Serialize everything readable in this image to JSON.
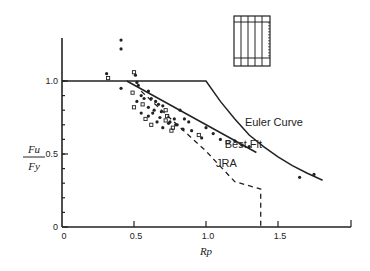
{
  "chart_data": {
    "type": "scatter",
    "title": "",
    "xlabel": "Rp",
    "ylabel": "Fu / Fy",
    "ylabel_num": "Fu",
    "ylabel_den": "Fy",
    "xlim": [
      0,
      2.0
    ],
    "ylim": [
      0,
      1.35
    ],
    "grid": false,
    "x_ticks": [
      0,
      0.5,
      1.0,
      1.5
    ],
    "x_tick_labels": [
      "0",
      "0.5",
      "1.0",
      "1.5"
    ],
    "y_ticks": [
      0,
      0.5,
      1.0
    ],
    "y_tick_labels": [
      "0",
      "0.5",
      "1.0"
    ],
    "y_minor_step": 0.1,
    "series": [
      {
        "name": "Euler Curve",
        "kind": "line",
        "style": "solid",
        "x": [
          0,
          1.0,
          1.1,
          1.2,
          1.3,
          1.4,
          1.5,
          1.6,
          1.7,
          1.81
        ],
        "y": [
          1.0,
          1.0,
          0.86,
          0.74,
          0.63,
          0.55,
          0.48,
          0.42,
          0.37,
          0.32
        ]
      },
      {
        "name": "Best Fit",
        "kind": "line",
        "style": "solid",
        "x": [
          0.45,
          1.35
        ],
        "y": [
          1.0,
          0.51
        ]
      },
      {
        "name": "JRA",
        "kind": "line",
        "style": "dashed",
        "x": [
          0.55,
          0.8,
          1.0,
          1.2,
          1.38,
          1.38
        ],
        "y": [
          0.93,
          0.7,
          0.52,
          0.31,
          0.26,
          0.0
        ]
      },
      {
        "name": "Test Data",
        "kind": "scatter",
        "x": [
          0.31,
          0.32,
          0.41,
          0.41,
          0.41,
          0.5,
          0.51,
          0.52,
          0.53,
          0.49,
          0.55,
          0.57,
          0.52,
          0.5,
          0.6,
          0.62,
          0.55,
          0.58,
          0.65,
          0.67,
          0.7,
          0.72,
          0.6,
          0.63,
          0.68,
          0.73,
          0.78,
          0.8,
          0.75,
          0.77,
          0.82,
          0.85,
          0.88,
          0.62,
          0.66,
          0.7,
          0.74,
          0.76,
          0.79,
          0.84,
          0.9,
          0.95,
          1.0,
          1.05,
          1.1,
          1.15,
          1.2,
          1.25,
          1.3,
          0.56,
          0.6,
          0.64,
          0.69,
          0.72,
          0.97,
          1.65,
          1.75
        ],
        "y": [
          1.05,
          1.02,
          1.28,
          1.22,
          0.95,
          1.06,
          1.04,
          0.99,
          0.97,
          0.92,
          0.9,
          0.88,
          0.86,
          0.82,
          0.93,
          0.88,
          0.78,
          0.74,
          0.86,
          0.84,
          0.83,
          0.8,
          0.76,
          0.78,
          0.75,
          0.76,
          0.74,
          0.7,
          0.72,
          0.68,
          0.8,
          0.74,
          0.72,
          0.7,
          0.72,
          0.68,
          0.71,
          0.66,
          0.7,
          0.67,
          0.66,
          0.63,
          0.68,
          0.64,
          0.6,
          0.58,
          0.59,
          0.56,
          0.55,
          0.84,
          0.82,
          0.8,
          0.79,
          0.73,
          0.61,
          0.34,
          0.36
        ]
      }
    ],
    "annotations": [
      {
        "text": "Euler Curve",
        "x": 1.27,
        "y": 0.69
      },
      {
        "text": "Best Fit",
        "x": 1.13,
        "y": 0.54
      },
      {
        "text": "JRA",
        "x": 1.07,
        "y": 0.41
      }
    ],
    "legend": null
  },
  "inset": {
    "description": "stiffened panel sketch",
    "name": "panel-diagram"
  }
}
